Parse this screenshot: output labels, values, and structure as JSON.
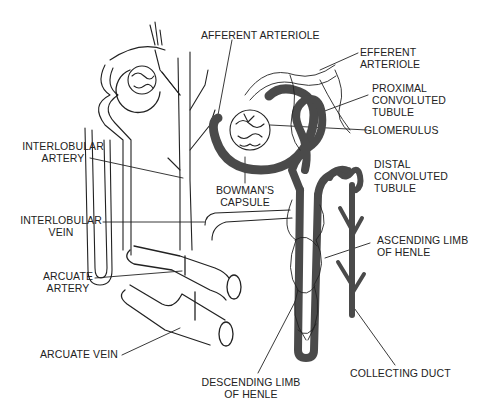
{
  "diagram": {
    "colors": {
      "tubule": "#4a4a4a",
      "vessel_outline": "#222222",
      "background": "#ffffff"
    },
    "labels": {
      "afferent_arteriole": "AFFERENT ARTERIOLE",
      "efferent_arteriole_1": "EFFERENT",
      "efferent_arteriole_2": "ARTERIOLE",
      "proximal_1": "PROXIMAL",
      "proximal_2": "CONVOLUTED",
      "proximal_3": "TUBULE",
      "glomerulus": "GLOMERULUS",
      "interlobular_artery_1": "INTERLOBULAR",
      "interlobular_artery_2": "ARTERY",
      "bowmans_1": "BOWMAN'S",
      "bowmans_2": "CAPSULE",
      "distal_1": "DISTAL",
      "distal_2": "CONVOLUTED",
      "distal_3": "TUBULE",
      "interlobular_vein_1": "INTERLOBULAR",
      "interlobular_vein_2": "VEIN",
      "ascending_1": "ASCENDING LIMB",
      "ascending_2": "OF HENLE",
      "arcuate_artery_1": "ARCUATE",
      "arcuate_artery_2": "ARTERY",
      "arcuate_vein": "ARCUATE VEIN",
      "descending_1": "DESCENDING LIMB",
      "descending_2": "OF HENLE",
      "collecting_duct": "COLLECTING DUCT"
    }
  }
}
